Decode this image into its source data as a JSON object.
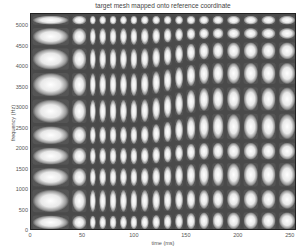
{
  "chart_data": {
    "type": "heatmap",
    "title": "target mesh mapped onto reference coordinate",
    "xlabel": "time (ms)",
    "ylabel": "frequency (Hz)",
    "xlim": [
      0,
      256
    ],
    "ylim": [
      0,
      5300
    ],
    "xticks": [
      "0",
      "50",
      "100",
      "150",
      "200",
      "250"
    ],
    "yticks": [
      "0",
      "500",
      "1000",
      "1500",
      "2000",
      "2500",
      "3000",
      "3500",
      "4000",
      "4500",
      "5000"
    ],
    "grid": false,
    "colormap": "gray",
    "column_boundaries_ms": [
      0,
      38,
      55,
      64,
      74,
      84,
      94,
      104,
      115,
      126,
      137,
      148,
      160,
      173,
      187,
      203,
      220,
      237,
      256
    ],
    "row_boundaries_hz_left": [
      0,
      420,
      1050,
      1580,
      2080,
      2600,
      3250,
      3900,
      4500,
      5000,
      5300
    ],
    "row_boundaries_hz_right": [
      0,
      500,
      1050,
      1700,
      2200,
      2900,
      3550,
      4150,
      4650,
      5000,
      5300
    ],
    "warp_region_ms": [
      100,
      175
    ]
  }
}
